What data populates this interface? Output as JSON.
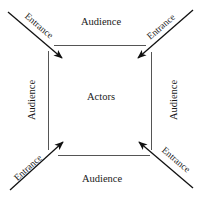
{
  "diagram": {
    "center_label": "Actors",
    "audience": {
      "top": "Audience",
      "bottom": "Audience",
      "left": "Audience",
      "right": "Audience"
    },
    "entrances": {
      "top_left": "Entrance",
      "top_right": "Entrance",
      "bottom_left": "Entrance",
      "bottom_right": "Entrance"
    },
    "colors": {
      "box_stroke": "#555555",
      "arrow": "#111111",
      "text": "#1a1a1a",
      "background": "#ffffff"
    }
  }
}
